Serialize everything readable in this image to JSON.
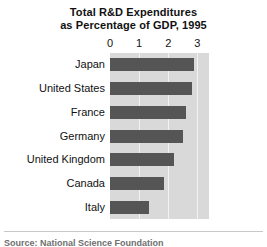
{
  "chart_data": {
    "type": "bar",
    "orientation": "horizontal",
    "title": "Total R&D Expenditures as Percentage of GDP, 1995",
    "title_lines": [
      "Total R&D Expenditures",
      "as Percentage of GDP, 1995"
    ],
    "xlabel": "",
    "ylabel": "",
    "categories": [
      "Japan",
      "United States",
      "France",
      "Germany",
      "United Kingdom",
      "Canada",
      "Italy"
    ],
    "values": [
      2.9,
      2.8,
      2.6,
      2.5,
      2.2,
      1.85,
      1.35
    ],
    "xlim": [
      0,
      3.4
    ],
    "xticks": [
      0,
      1,
      2,
      3
    ],
    "xtick_labels": [
      "0",
      "1",
      "2",
      "3"
    ],
    "grid": true,
    "legend": "none",
    "bar_color": "#555555",
    "panel_color": "#d9d9d9",
    "gridline_color": "#f2f2f2"
  },
  "footer": {
    "source": "Source: National Science Foundation"
  }
}
